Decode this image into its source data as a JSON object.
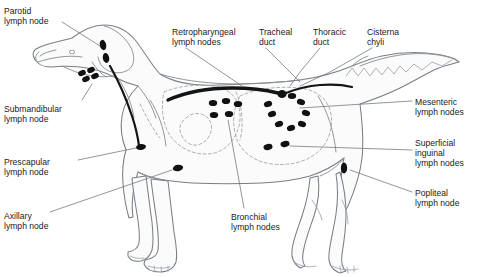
{
  "diagram": {
    "background_color": "#ffffff",
    "outline_color": "#7a7f86",
    "node_color": "#111111",
    "duct_color": "#141414",
    "dashed_color": "#9aa0a6",
    "leader_color": "#6e737a"
  },
  "labels": [
    {
      "id": "parotid",
      "name": "parotid-lymph-node-label",
      "line1": "Parotid",
      "line2": "lymph node",
      "line3": "",
      "x": 4,
      "y": 6,
      "align": "left"
    },
    {
      "id": "retropharyngeal",
      "name": "retropharyngeal-lymph-nodes-label",
      "line1": "Retropharyngeal",
      "line2": "lymph nodes",
      "line3": "",
      "x": 172,
      "y": 27,
      "align": "left"
    },
    {
      "id": "tracheal",
      "name": "tracheal-duct-label",
      "line1": "Tracheal",
      "line2": "duct",
      "line3": "",
      "x": 259,
      "y": 27,
      "align": "left"
    },
    {
      "id": "thoracic",
      "name": "thoracic-duct-label",
      "line1": "Thoracic",
      "line2": "duct",
      "line3": "",
      "x": 313,
      "y": 27,
      "align": "left"
    },
    {
      "id": "cisterna",
      "name": "cisterna-chyli-label",
      "line1": "Cisterna",
      "line2": "chyli",
      "line3": "",
      "x": 367,
      "y": 27,
      "align": "left"
    },
    {
      "id": "submandibular",
      "name": "submandibular-lymph-node-label",
      "line1": "Submandibular",
      "line2": "lymph node",
      "line3": "",
      "x": 4,
      "y": 104,
      "align": "left"
    },
    {
      "id": "prescapular",
      "name": "prescapular-lymph-node-label",
      "line1": "Prescapular",
      "line2": "lymph node",
      "line3": "",
      "x": 4,
      "y": 157,
      "align": "left"
    },
    {
      "id": "axillary",
      "name": "axillary-lymph-node-label",
      "line1": "Axillary",
      "line2": "lymph node",
      "line3": "",
      "x": 4,
      "y": 211,
      "align": "left"
    },
    {
      "id": "mesenteric",
      "name": "mesenteric-lymph-nodes-label",
      "line1": "Mesenteric",
      "line2": "lymph nodes",
      "line3": "",
      "x": 415,
      "y": 97,
      "align": "left"
    },
    {
      "id": "inguinal",
      "name": "superficial-inguinal-lymph-nodes-label",
      "line1": "Superficial",
      "line2": "inguinal",
      "line3": "lymph nodes",
      "x": 415,
      "y": 138,
      "align": "left"
    },
    {
      "id": "popliteal",
      "name": "popliteal-lymph-node-label",
      "line1": "Popliteal",
      "line2": "lymph node",
      "line3": "",
      "x": 415,
      "y": 188,
      "align": "left"
    },
    {
      "id": "bronchial",
      "name": "bronchial-lymph-nodes-label",
      "line1": "Bronchial",
      "line2": "lymph nodes",
      "line3": "",
      "x": 231,
      "y": 212,
      "align": "left"
    }
  ],
  "lymph_node_groups": [
    {
      "id": "parotid",
      "label": "Parotid lymph node",
      "count": 2,
      "nodes": [
        {
          "cx": 103,
          "cy": 45,
          "rx": 3.2,
          "ry": 5.2,
          "rot": -12
        },
        {
          "cx": 106,
          "cy": 58,
          "rx": 3.2,
          "ry": 5.0,
          "rot": -10
        }
      ]
    },
    {
      "id": "submandibular",
      "label": "Submandibular lymph node",
      "count": 4,
      "nodes": [
        {
          "cx": 82,
          "cy": 73,
          "rx": 4.0,
          "ry": 2.8,
          "rot": -22
        },
        {
          "cx": 91,
          "cy": 70,
          "rx": 4.0,
          "ry": 2.8,
          "rot": -22
        },
        {
          "cx": 86,
          "cy": 79,
          "rx": 4.0,
          "ry": 2.8,
          "rot": -22
        },
        {
          "cx": 95,
          "cy": 76,
          "rx": 4.0,
          "ry": 2.8,
          "rot": -22
        }
      ]
    },
    {
      "id": "prescapular",
      "label": "Prescapular lymph node",
      "count": 1,
      "nodes": [
        {
          "cx": 141,
          "cy": 147,
          "rx": 5.0,
          "ry": 3.0,
          "rot": -8
        }
      ]
    },
    {
      "id": "axillary",
      "label": "Axillary lymph node",
      "count": 1,
      "nodes": [
        {
          "cx": 178,
          "cy": 168,
          "rx": 5.2,
          "ry": 3.2,
          "rot": -10
        }
      ]
    },
    {
      "id": "bronchial",
      "label": "Bronchial lymph nodes",
      "count": 5,
      "nodes": [
        {
          "cx": 213,
          "cy": 103,
          "rx": 4.2,
          "ry": 3.1,
          "rot": 0
        },
        {
          "cx": 226,
          "cy": 101,
          "rx": 4.2,
          "ry": 3.1,
          "rot": 0
        },
        {
          "cx": 238,
          "cy": 104,
          "rx": 4.2,
          "ry": 3.1,
          "rot": 0
        },
        {
          "cx": 214,
          "cy": 115,
          "rx": 4.2,
          "ry": 3.1,
          "rot": 0
        },
        {
          "cx": 229,
          "cy": 114,
          "rx": 4.2,
          "ry": 3.1,
          "rot": 0
        }
      ]
    },
    {
      "id": "mesenteric",
      "label": "Mesenteric lymph nodes",
      "count": 8,
      "nodes": [
        {
          "cx": 268,
          "cy": 104,
          "rx": 4.2,
          "ry": 3.0,
          "rot": -18
        },
        {
          "cx": 272,
          "cy": 114,
          "rx": 4.2,
          "ry": 3.0,
          "rot": -18
        },
        {
          "cx": 279,
          "cy": 124,
          "rx": 4.2,
          "ry": 3.0,
          "rot": -18
        },
        {
          "cx": 291,
          "cy": 128,
          "rx": 4.2,
          "ry": 3.0,
          "rot": -18
        },
        {
          "cx": 302,
          "cy": 124,
          "rx": 4.2,
          "ry": 3.0,
          "rot": 18
        },
        {
          "cx": 306,
          "cy": 113,
          "rx": 4.2,
          "ry": 3.0,
          "rot": 18
        },
        {
          "cx": 301,
          "cy": 102,
          "rx": 4.2,
          "ry": 3.0,
          "rot": 18
        },
        {
          "cx": 292,
          "cy": 96,
          "rx": 4.2,
          "ry": 3.0,
          "rot": 0
        }
      ]
    },
    {
      "id": "inguinal",
      "label": "Superficial inguinal lymph nodes",
      "count": 2,
      "nodes": [
        {
          "cx": 268,
          "cy": 147,
          "rx": 4.6,
          "ry": 3.0,
          "rot": -14
        },
        {
          "cx": 285,
          "cy": 144,
          "rx": 4.6,
          "ry": 3.0,
          "rot": -14
        }
      ]
    },
    {
      "id": "popliteal",
      "label": "Popliteal lymph node",
      "count": 1,
      "nodes": [
        {
          "cx": 344,
          "cy": 168,
          "rx": 3.2,
          "ry": 5.4,
          "rot": 0
        }
      ]
    }
  ],
  "ducts": [
    {
      "id": "tracheal-duct",
      "label": "Tracheal duct",
      "color": "#141414"
    },
    {
      "id": "thoracic-duct",
      "label": "Thoracic duct",
      "color": "#141414"
    },
    {
      "id": "cisterna-chyli",
      "label": "Cisterna chyli",
      "color": "#141414"
    }
  ]
}
